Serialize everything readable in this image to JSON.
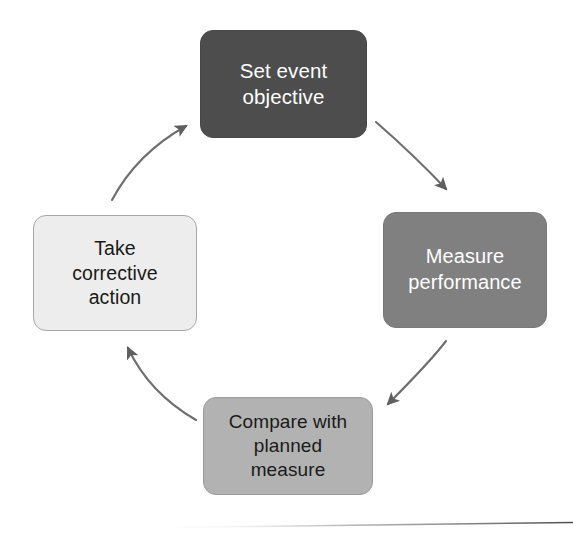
{
  "diagram": {
    "type": "cycle",
    "direction": "clockwise",
    "background_color": "#ffffff",
    "nodes": [
      {
        "id": "set-event-objective",
        "order": 1,
        "position": "top",
        "label": "Set event\nobjective",
        "fill_color": "#4d4d4d",
        "text_color": "#ffffff"
      },
      {
        "id": "measure-performance",
        "order": 2,
        "position": "right",
        "label": "Measure\nperformance",
        "fill_color": "#808080",
        "text_color": "#ffffff"
      },
      {
        "id": "compare-with-planned-measure",
        "order": 3,
        "position": "bottom",
        "label": "Compare with\nplanned\nmeasure",
        "fill_color": "#b2b2b2",
        "text_color": "#1a1a1a"
      },
      {
        "id": "take-corrective-action",
        "order": 4,
        "position": "left",
        "label": "Take\ncorrective\naction",
        "fill_color": "#ededed",
        "text_color": "#1a1a1a"
      }
    ],
    "connectors": [
      {
        "id": "arrow-objective-to-measure",
        "from": "set-event-objective",
        "to": "measure-performance",
        "style": "curved-arrow",
        "color": "#6e6e6e"
      },
      {
        "id": "arrow-measure-to-compare",
        "from": "measure-performance",
        "to": "compare-with-planned-measure",
        "style": "curved-arrow",
        "color": "#6e6e6e"
      },
      {
        "id": "arrow-compare-to-corrective",
        "from": "compare-with-planned-measure",
        "to": "take-corrective-action",
        "style": "curved-arrow",
        "color": "#6e6e6e"
      },
      {
        "id": "arrow-corrective-to-objective",
        "from": "take-corrective-action",
        "to": "set-event-objective",
        "style": "curved-arrow",
        "color": "#6e6e6e"
      }
    ],
    "footer_rule": {
      "visible": true,
      "color": "#8a8a8a"
    }
  }
}
